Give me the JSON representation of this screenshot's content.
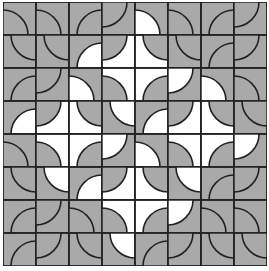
{
  "game": {
    "type": "truchet-tile-puzzle",
    "rows": 8,
    "cols": 8,
    "colors": {
      "gray": "#a9a9a9",
      "white": "#ffffff",
      "line": "#222222"
    },
    "tile_legend": "each tile = [corner, inside-arc color, outside-arc color]; corner in TL/TR/BL/BR",
    "tiles": [
      [
        [
          "BL",
          "g",
          "g"
        ],
        [
          "BL",
          "g",
          "g"
        ],
        [
          "BR",
          "g",
          "g"
        ],
        [
          "TL",
          "g",
          "g"
        ],
        [
          "BL",
          "w",
          "g"
        ],
        [
          "BL",
          "g",
          "g"
        ],
        [
          "BR",
          "g",
          "g"
        ],
        [
          "TL",
          "g",
          "g"
        ]
      ],
      [
        [
          "TR",
          "g",
          "g"
        ],
        [
          "TR",
          "g",
          "g"
        ],
        [
          "BR",
          "w",
          "g"
        ],
        [
          "TL",
          "g",
          "w"
        ],
        [
          "TR",
          "g",
          "w"
        ],
        [
          "TR",
          "g",
          "g"
        ],
        [
          "BR",
          "g",
          "g"
        ],
        [
          "TL",
          "g",
          "g"
        ]
      ],
      [
        [
          "BR",
          "g",
          "g"
        ],
        [
          "TL",
          "g",
          "g"
        ],
        [
          "BL",
          "w",
          "g"
        ],
        [
          "BL",
          "g",
          "w"
        ],
        [
          "BR",
          "g",
          "w"
        ],
        [
          "TL",
          "w",
          "g"
        ],
        [
          "BL",
          "w",
          "g"
        ],
        [
          "BL",
          "g",
          "g"
        ]
      ],
      [
        [
          "BR",
          "w",
          "g"
        ],
        [
          "TL",
          "g",
          "w"
        ],
        [
          "TR",
          "g",
          "w"
        ],
        [
          "TR",
          "w",
          "g"
        ],
        [
          "BR",
          "w",
          "g"
        ],
        [
          "TL",
          "g",
          "w"
        ],
        [
          "TR",
          "g",
          "w"
        ],
        [
          "TR",
          "g",
          "g"
        ]
      ],
      [
        [
          "BL",
          "g",
          "g"
        ],
        [
          "BL",
          "g",
          "w"
        ],
        [
          "BR",
          "g",
          "w"
        ],
        [
          "TL",
          "w",
          "g"
        ],
        [
          "BL",
          "w",
          "g"
        ],
        [
          "BL",
          "g",
          "w"
        ],
        [
          "BR",
          "g",
          "w"
        ],
        [
          "TL",
          "w",
          "g"
        ]
      ],
      [
        [
          "TR",
          "g",
          "g"
        ],
        [
          "TR",
          "w",
          "g"
        ],
        [
          "BR",
          "w",
          "g"
        ],
        [
          "TL",
          "g",
          "w"
        ],
        [
          "TR",
          "g",
          "w"
        ],
        [
          "TR",
          "w",
          "g"
        ],
        [
          "BR",
          "g",
          "g"
        ],
        [
          "TL",
          "g",
          "g"
        ]
      ],
      [
        [
          "BR",
          "g",
          "g"
        ],
        [
          "TL",
          "g",
          "g"
        ],
        [
          "BL",
          "g",
          "g"
        ],
        [
          "BL",
          "g",
          "w"
        ],
        [
          "BR",
          "g",
          "w"
        ],
        [
          "TL",
          "w",
          "g"
        ],
        [
          "BL",
          "g",
          "g"
        ],
        [
          "BL",
          "g",
          "g"
        ]
      ],
      [
        [
          "BR",
          "g",
          "g"
        ],
        [
          "TL",
          "g",
          "g"
        ],
        [
          "TR",
          "g",
          "g"
        ],
        [
          "TR",
          "w",
          "g"
        ],
        [
          "BR",
          "g",
          "g"
        ],
        [
          "TL",
          "g",
          "g"
        ],
        [
          "TR",
          "g",
          "g"
        ],
        [
          "TR",
          "g",
          "g"
        ]
      ]
    ]
  }
}
